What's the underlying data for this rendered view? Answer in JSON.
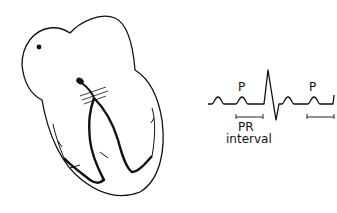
{
  "diagram": {
    "left": {
      "subject": "heart conduction system"
    },
    "right": {
      "subject": "ECG trace",
      "labels": {
        "p1": "P",
        "p2": "P",
        "pr_line1": "PR",
        "pr_line2": "interval"
      }
    }
  },
  "colors": {
    "stroke": "#111111",
    "background": "#ffffff"
  }
}
